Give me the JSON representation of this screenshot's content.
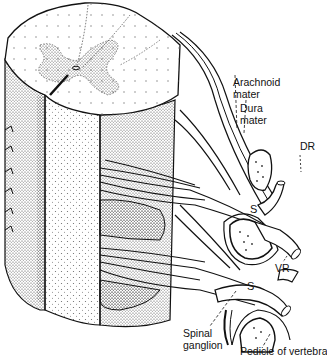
{
  "diagram": {
    "colors": {
      "ink": "#111111",
      "background": "#ffffff",
      "stipple": "#555555"
    },
    "labels": {
      "arachnoid_line1": "Arachnoid",
      "arachnoid_line2": "mater",
      "dura_line1": "Dura",
      "dura_line2": "mater",
      "dr": "DR",
      "vr": "VR",
      "s_upper": "S",
      "s_lower": "S",
      "spinal_ganglion_line1": "Spinal",
      "spinal_ganglion_line2": "ganglion",
      "pedicle": "Pedicle of vertebra"
    }
  }
}
